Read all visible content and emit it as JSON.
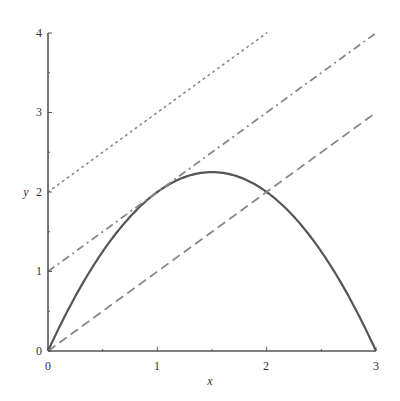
{
  "chart_data": {
    "type": "line",
    "title": "",
    "xlabel": "x",
    "ylabel": "y",
    "xlim": [
      0,
      3
    ],
    "ylim": [
      0,
      4
    ],
    "grid": false,
    "legend": null,
    "x_ticks": [
      "0",
      "1",
      "2",
      "3"
    ],
    "y_ticks": [
      "0",
      "1",
      "2",
      "3",
      "4"
    ],
    "series": [
      {
        "name": "y = x(3 - x)",
        "style": "solid",
        "color": "#555555",
        "x": [
          0,
          0.25,
          0.5,
          0.75,
          1,
          1.25,
          1.5,
          1.75,
          2,
          2.25,
          2.5,
          2.75,
          3
        ],
        "y": [
          0,
          0.6875,
          1.25,
          1.6875,
          2,
          2.1875,
          2.25,
          2.1875,
          2,
          1.6875,
          1.25,
          0.6875,
          0
        ]
      },
      {
        "name": "y = x",
        "style": "dashed",
        "color": "#888888",
        "x": [
          0,
          3
        ],
        "y": [
          0,
          3
        ]
      },
      {
        "name": "y = x + 1",
        "style": "dash-dot",
        "color": "#888888",
        "x": [
          0,
          3
        ],
        "y": [
          1,
          4
        ]
      },
      {
        "name": "y = x + 2",
        "style": "dotted",
        "color": "#888888",
        "x": [
          0,
          2
        ],
        "y": [
          2,
          4
        ]
      }
    ]
  },
  "axes": {
    "x_label": "x",
    "y_label": "y",
    "x_tick_labels": [
      "0",
      "1",
      "2",
      "3"
    ],
    "y_tick_labels": [
      "0",
      "1",
      "2",
      "3",
      "4"
    ]
  }
}
